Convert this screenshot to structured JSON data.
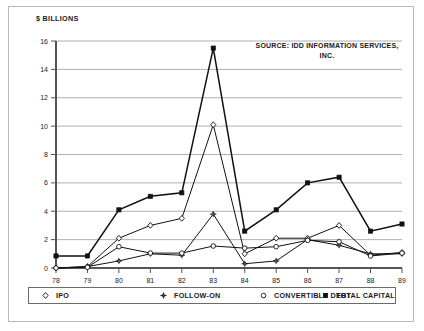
{
  "figure": {
    "ylabel": "$ BILLIONS",
    "source_note": "SOURCE: IDD INFORMATION SERVICES, INC.",
    "colors": {
      "frame": "#b9b9b9",
      "grid": "#9a9a9a",
      "axis": "#555555",
      "line": "#111111",
      "text": "#1a1a1a",
      "background": "#ffffff"
    }
  },
  "legend": {
    "items": [
      {
        "label": "IPO",
        "marker": "open-diamond-marker"
      },
      {
        "label": "FOLLOW-ON",
        "marker": "open-star-marker"
      },
      {
        "label": "CONVERTIBLE DEBT",
        "marker": "open-circle-marker"
      },
      {
        "label": "TOTAL CAPITAL",
        "marker": "filled-square-marker"
      }
    ]
  },
  "axes": {
    "y_ticks": [
      "0",
      "2",
      "4",
      "6",
      "8",
      "10",
      "12",
      "14",
      "16"
    ],
    "x_ticks": [
      "78",
      "79",
      "80",
      "81",
      "82",
      "83",
      "84",
      "85",
      "86",
      "87",
      "88",
      "89"
    ]
  },
  "chart_data": {
    "type": "line",
    "title": "",
    "subtitle": "",
    "xlabel": "",
    "ylabel": "$ BILLIONS",
    "annotations": [
      "SOURCE: IDD INFORMATION SERVICES, INC."
    ],
    "grid": true,
    "legend_position": "bottom",
    "categories": [
      "78",
      "79",
      "80",
      "81",
      "82",
      "83",
      "84",
      "85",
      "86",
      "87",
      "88",
      "89"
    ],
    "x": [
      78,
      79,
      80,
      81,
      82,
      83,
      84,
      85,
      86,
      87,
      88,
      89
    ],
    "xlim": [
      78,
      89
    ],
    "ylim": [
      0,
      16
    ],
    "y_tick_step": 2,
    "series": [
      {
        "name": "IPO",
        "marker": "open-diamond-marker",
        "values": [
          0.0,
          0.1,
          2.1,
          3.0,
          3.5,
          10.1,
          1.0,
          2.1,
          2.1,
          3.0,
          0.9,
          1.1
        ]
      },
      {
        "name": "FOLLOW-ON",
        "marker": "open-star-marker",
        "values": [
          0.0,
          0.1,
          0.5,
          1.0,
          0.9,
          3.8,
          0.3,
          0.5,
          2.0,
          1.6,
          1.0,
          1.0
        ]
      },
      {
        "name": "CONVERTIBLE DEBT",
        "marker": "open-circle-marker",
        "values": [
          0.0,
          0.05,
          1.5,
          1.05,
          1.05,
          1.55,
          1.4,
          1.5,
          1.95,
          1.85,
          0.85,
          1.05
        ]
      },
      {
        "name": "TOTAL CAPITAL",
        "marker": "filled-square-marker",
        "values": [
          0.85,
          0.85,
          4.1,
          5.05,
          5.3,
          15.5,
          2.6,
          4.1,
          6.0,
          6.4,
          2.6,
          3.1
        ]
      }
    ]
  }
}
